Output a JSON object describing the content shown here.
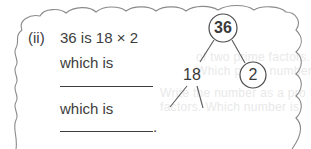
{
  "problem": {
    "label": "(ii)",
    "statement": "36 is 18 × 2",
    "lines": [
      {
        "text": "which is",
        "answer": ""
      },
      {
        "text": "which is",
        "answer": "",
        "terminator": "."
      }
    ]
  },
  "factor_tree": {
    "root": {
      "value": "36",
      "circled": true
    },
    "children": [
      {
        "value": "18",
        "circled": false,
        "children": [
          {
            "value": ""
          },
          {
            "value": ""
          }
        ]
      },
      {
        "value": "2",
        "circled": true
      }
    ]
  },
  "ghost_text": [
    "of two prime factors. Fi",
    "Which prime numbers are",
    "Write the number as a pro",
    "factors. Which number is"
  ],
  "colors": {
    "ink": "#3d3d3d",
    "cloud_border": "#8a8a8a",
    "ghost": "#e9e9e9",
    "background": "#ffffff"
  }
}
